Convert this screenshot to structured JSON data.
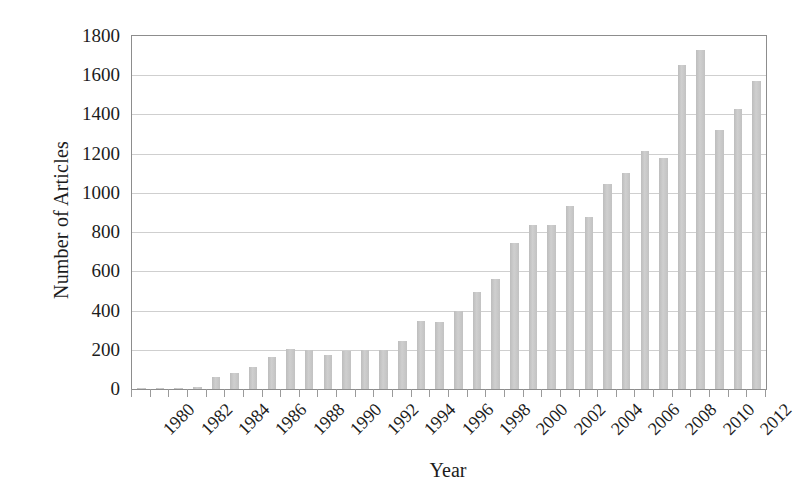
{
  "chart_data": {
    "type": "bar",
    "title": "",
    "xlabel": "Year",
    "ylabel": "Number of Articles",
    "ylim": [
      0,
      1800
    ],
    "ytick_step": 200,
    "yticks": [
      1800,
      1600,
      1400,
      1200,
      1000,
      800,
      600,
      400,
      200,
      0
    ],
    "grid": true,
    "legend": false,
    "bar_color": "#c6c6c6",
    "axis_color": "#8d8d8d",
    "grid_color": "#cfcfcf",
    "text_color": "#1c1c1c",
    "xtick_labels": [
      "1980",
      "1982",
      "1984",
      "1986",
      "1988",
      "1990",
      "1992",
      "1994",
      "1996",
      "1998",
      "2000",
      "2002",
      "2004",
      "2006",
      "2008",
      "2010",
      "2012"
    ],
    "categories": [
      "1980",
      "1981",
      "1982",
      "1983",
      "1984",
      "1985",
      "1986",
      "1987",
      "1988",
      "1989",
      "1990",
      "1991",
      "1992",
      "1993",
      "1994",
      "1995",
      "1996",
      "1997",
      "1998",
      "1999",
      "2000",
      "2001",
      "2002",
      "2003",
      "2004",
      "2005",
      "2006",
      "2007",
      "2008",
      "2009",
      "2010",
      "2011",
      "2012",
      "2013"
    ],
    "values": [
      3,
      4,
      5,
      8,
      60,
      80,
      110,
      165,
      205,
      200,
      175,
      195,
      200,
      200,
      245,
      345,
      340,
      400,
      495,
      560,
      745,
      835,
      835,
      935,
      875,
      1045,
      1100,
      1215,
      1180,
      1650,
      1730,
      1320,
      1430,
      1570
    ]
  }
}
